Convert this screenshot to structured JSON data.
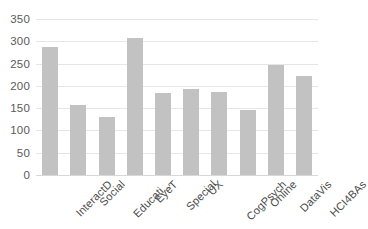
{
  "chart_data": {
    "type": "bar",
    "title": "",
    "subtitle": "",
    "xlabel": "",
    "ylabel": "",
    "categories": [
      "InteractD",
      "Social",
      "Educati...",
      "EyeT",
      "Special",
      "UX",
      "CogPsych",
      "Online",
      "DataVis",
      "HCI4BAs"
    ],
    "values": [
      288,
      157,
      130,
      307,
      183,
      192,
      187,
      145,
      246,
      223
    ],
    "series": [
      {
        "name": "",
        "values": [
          288,
          157,
          130,
          307,
          183,
          192,
          187,
          145,
          246,
          223
        ]
      }
    ],
    "ylim": [
      0,
      350
    ],
    "yticks": [
      0,
      50,
      100,
      150,
      200,
      250,
      300,
      350
    ],
    "ytick_labels": [
      "0",
      "50",
      "100",
      "150",
      "200",
      "250",
      "300",
      "350"
    ],
    "grid": true,
    "grid_axis": "y",
    "legend": false,
    "legend_position": "none",
    "bar_color": "#c2c2c2",
    "gridline_color": "#e6e6e6",
    "tick_label_color": "#5a5a5a",
    "category_label_color": "#4a4a4a",
    "background_color": "#ffffff",
    "category_label_rotation": -45
  }
}
